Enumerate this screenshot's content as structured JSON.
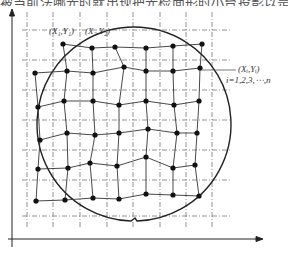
{
  "figure": {
    "top_caption_fragment": "被当前法哪光时就出现把光检面形时小台投影以是...",
    "labels": {
      "p1": "(X₁,Y₁)",
      "p2": "(X₂,Y₂)",
      "pi": "(Xᵢ,Yᵢ)",
      "index": "i=1,2,3,⋯,n"
    },
    "axes": {
      "x_axis": "horizontal-arrow",
      "y_axis": "vertical-arrow"
    },
    "reference_grid": {
      "style": "dash-dot",
      "vertical_x": [
        27,
        53,
        80,
        107,
        133,
        160,
        186,
        212
      ],
      "horizontal_y": [
        30,
        60,
        90,
        120,
        150,
        180,
        216
      ]
    },
    "wafer_circle": {
      "cx": 120,
      "cy": 124,
      "r": 97,
      "notch": "bottom"
    },
    "measured_points": [
      [
        [
          63,
          44
        ],
        [
          92,
          48
        ],
        [
          115,
          47
        ],
        [
          146,
          48
        ],
        [
          173,
          46
        ],
        [
          202,
          44
        ]
      ],
      [
        [
          35,
          73
        ],
        [
          67,
          71
        ],
        [
          93,
          73
        ],
        [
          124,
          67
        ],
        [
          146,
          71
        ],
        [
          173,
          71
        ],
        [
          200,
          68
        ]
      ],
      [
        [
          38,
          107
        ],
        [
          64,
          101
        ],
        [
          93,
          101
        ],
        [
          119,
          105
        ],
        [
          146,
          101
        ],
        [
          174,
          105
        ],
        [
          199,
          101
        ]
      ],
      [
        [
          40,
          140
        ],
        [
          67,
          133
        ],
        [
          95,
          135
        ],
        [
          119,
          133
        ],
        [
          148,
          129
        ],
        [
          177,
          133
        ],
        [
          197,
          133
        ]
      ],
      [
        [
          38,
          169
        ],
        [
          68,
          168
        ],
        [
          90,
          163
        ],
        [
          117,
          166
        ],
        [
          146,
          157
        ],
        [
          173,
          168
        ],
        [
          195,
          165
        ]
      ],
      [
        [
          36,
          201
        ],
        [
          65,
          200
        ],
        [
          93,
          198
        ],
        [
          119,
          199
        ],
        [
          146,
          194
        ],
        [
          173,
          195
        ],
        [
          199,
          196
        ]
      ]
    ],
    "colors": {
      "line": "#222222",
      "grid": "#777777",
      "text": "#333333"
    }
  }
}
